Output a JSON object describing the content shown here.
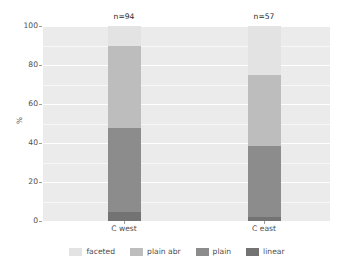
{
  "chart_data": {
    "type": "bar",
    "subtype": "stacked-percent",
    "title": "",
    "xlabel": "",
    "ylabel": "%",
    "ylim": [
      0,
      100
    ],
    "yticks": [
      0,
      20,
      40,
      60,
      80,
      100
    ],
    "ytick_labels": [
      "0",
      "20",
      "40",
      "60",
      "80",
      "100"
    ],
    "minor_yticks": [
      10,
      30,
      50,
      70,
      90
    ],
    "grid": true,
    "legend_position": "bottom",
    "categories": [
      "C west",
      "C east"
    ],
    "annotations": [
      "n=94",
      "n=57"
    ],
    "sample_sizes": [
      94,
      57
    ],
    "series": [
      {
        "name": "faceted",
        "color": "#e3e3e3",
        "values": [
          10.0,
          25.0
        ]
      },
      {
        "name": "plain abr",
        "color": "#bdbdbd",
        "values": [
          42.5,
          36.5
        ]
      },
      {
        "name": "plain",
        "color": "#8c8c8c",
        "values": [
          43.0,
          36.5
        ]
      },
      {
        "name": "linear",
        "color": "#737373",
        "values": [
          4.5,
          2.0
        ]
      }
    ]
  },
  "axes": {
    "y_title": "%",
    "y_tick_labels": [
      "100",
      "80",
      "60",
      "40",
      "20",
      "0"
    ],
    "x_tick_labels": [
      "C west",
      "C east"
    ]
  },
  "legend": {
    "items": [
      {
        "label": "faceted",
        "color": "#e3e3e3"
      },
      {
        "label": "plain abr",
        "color": "#bdbdbd"
      },
      {
        "label": "plain",
        "color": "#8c8c8c"
      },
      {
        "label": "linear",
        "color": "#737373"
      }
    ]
  },
  "annotations": {
    "bar_labels": [
      "n=94",
      "n=57"
    ]
  },
  "theme": {
    "panel_background": "#ebebeb",
    "gridline_color": "#ffffff",
    "page_background": "#ffffff",
    "text_color": "#4d4d4d"
  }
}
